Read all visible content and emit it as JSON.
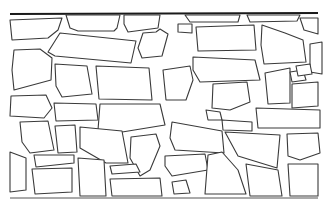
{
  "image": {
    "subject": "stone wall line drawing",
    "stroke_color": "#3a3a3a",
    "cap_color": "#1a1a1a",
    "background": "#ffffff"
  }
}
